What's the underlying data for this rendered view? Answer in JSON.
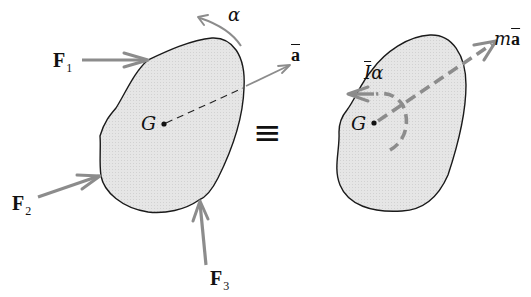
{
  "figure": {
    "equivalence_symbol": "≡",
    "colors": {
      "body_fill": "#e4e4e4",
      "body_outline": "#1a1a1a",
      "vector_gray": "#8c8c8c",
      "text": "#111111",
      "background": "#ffffff"
    },
    "left_body": {
      "center_label": "G",
      "forces": [
        {
          "id": "F1",
          "symbol": "F",
          "subscript": "1"
        },
        {
          "id": "F2",
          "symbol": "F",
          "subscript": "2"
        },
        {
          "id": "F3",
          "symbol": "F",
          "subscript": "3"
        }
      ],
      "angular_acceleration_label": "α",
      "acceleration_label": "a"
    },
    "right_body": {
      "center_label": "G",
      "moment_label_I": "I",
      "moment_label_alpha": "α",
      "inertial_force_m": "m",
      "inertial_force_a": "a"
    }
  }
}
